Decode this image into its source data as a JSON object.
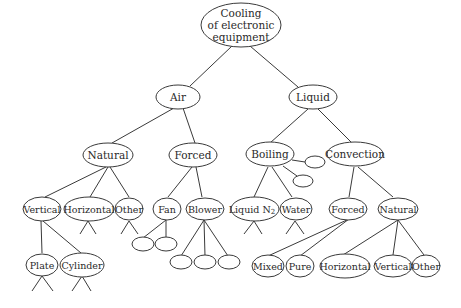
{
  "diagram": {
    "title": "Cooling of electronic equipment",
    "root": {
      "lines": [
        "Cooling",
        "of electronic",
        "equipment"
      ]
    },
    "nodes": {
      "air": "Air",
      "liquid": "Liquid",
      "air_natural": "Natural",
      "air_forced": "Forced",
      "boiling": "Boiling",
      "convection": "Convection",
      "vertical": "Vertical",
      "horizontal": "Horizontal",
      "air_other": "Other",
      "fan": "Fan",
      "blower": "Blower",
      "liquid_n2_base": "Liquid N",
      "liquid_n2_sub": "2",
      "water": "Water",
      "conv_forced": "Forced",
      "conv_natural": "Natural",
      "plate": "Plate",
      "cylinder": "Cylinder",
      "mixed": "Mixed",
      "pure": "Pure",
      "conv_horizontal": "Horizontal",
      "conv_vertical": "Vertical",
      "conv_other": "Other"
    },
    "edges": [
      [
        "root",
        "air"
      ],
      [
        "root",
        "liquid"
      ],
      [
        "air",
        "air_natural"
      ],
      [
        "air",
        "air_forced"
      ],
      [
        "liquid",
        "boiling"
      ],
      [
        "liquid",
        "convection"
      ],
      [
        "air_natural",
        "vertical"
      ],
      [
        "air_natural",
        "horizontal"
      ],
      [
        "air_natural",
        "air_other"
      ],
      [
        "air_forced",
        "fan"
      ],
      [
        "air_forced",
        "blower"
      ],
      [
        "boiling",
        "liquid_n2"
      ],
      [
        "boiling",
        "water"
      ],
      [
        "boiling",
        "unlabeled"
      ],
      [
        "boiling",
        "unlabeled"
      ],
      [
        "convection",
        "conv_forced"
      ],
      [
        "convection",
        "conv_natural"
      ],
      [
        "vertical",
        "plate"
      ],
      [
        "vertical",
        "cylinder"
      ],
      [
        "fan",
        "unlabeled"
      ],
      [
        "fan",
        "unlabeled"
      ],
      [
        "blower",
        "unlabeled"
      ],
      [
        "blower",
        "unlabeled"
      ],
      [
        "blower",
        "unlabeled"
      ],
      [
        "conv_forced",
        "mixed"
      ],
      [
        "conv_forced",
        "pure"
      ],
      [
        "conv_natural",
        "conv_horizontal"
      ],
      [
        "conv_natural",
        "conv_vertical"
      ],
      [
        "conv_natural",
        "conv_other"
      ]
    ]
  }
}
